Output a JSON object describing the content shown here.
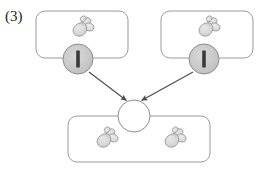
{
  "figure": {
    "label": "(3)",
    "type": "diagram",
    "colors": {
      "stroke": "#777777",
      "box_stroke": "#9a9a9a",
      "circle_fill_shaded": "#c9c9c9",
      "circle_fill_empty": "#ffffff",
      "bar_fill": "#3a3a3a",
      "organism_fill": "#d9d9d9",
      "organism_stroke": "#8a8a8a",
      "arrow": "#5a5a5a",
      "text": "#222222"
    },
    "boxes": [
      {
        "name": "parent-box-left",
        "x": 36,
        "y": 11,
        "width": 92,
        "height": 47,
        "radius": 9,
        "organisms": [
          {
            "name": "insect-left-top",
            "cx": 80,
            "cy": 29,
            "scale": 1.0,
            "flip": false
          }
        ],
        "node": {
          "name": "shaded-node-left",
          "cx": 78,
          "cy": 59,
          "r": 15,
          "state": "shaded",
          "has_bar": true
        }
      },
      {
        "name": "parent-box-right",
        "x": 161,
        "y": 11,
        "width": 92,
        "height": 47,
        "radius": 9,
        "organisms": [
          {
            "name": "insect-right-top",
            "cx": 206,
            "cy": 29,
            "scale": 1.0,
            "flip": false
          }
        ],
        "node": {
          "name": "shaded-node-right",
          "cx": 204,
          "cy": 59,
          "r": 15,
          "state": "shaded",
          "has_bar": true
        }
      },
      {
        "name": "offspring-box-bottom",
        "x": 68,
        "y": 116,
        "width": 142,
        "height": 46,
        "radius": 9,
        "organisms": [
          {
            "name": "insect-bottom-left",
            "cx": 104,
            "cy": 140,
            "scale": 1.0,
            "flip": false
          },
          {
            "name": "insect-bottom-right",
            "cx": 172,
            "cy": 140,
            "scale": 1.0,
            "flip": false
          }
        ],
        "node": null
      }
    ],
    "center_node": {
      "name": "offspring-node",
      "cx": 134,
      "cy": 116,
      "r": 16,
      "state": "empty",
      "has_bar": false
    },
    "arrows": [
      {
        "name": "arrow-left-to-center",
        "x1": 89,
        "y1": 72,
        "x2": 127,
        "y2": 101
      },
      {
        "name": "arrow-right-to-center",
        "x1": 193,
        "y1": 72,
        "x2": 141,
        "y2": 101
      }
    ]
  }
}
